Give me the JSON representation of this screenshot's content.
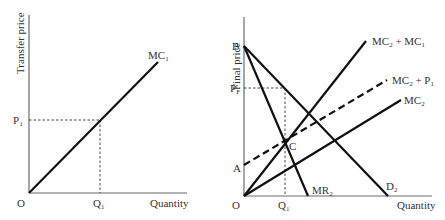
{
  "left_panel": {
    "y_axis_label": "Transfer price",
    "x_axis_label": "Quantity",
    "origin_label": "O",
    "curves": [
      {
        "id": "mc1",
        "label": "MC",
        "sub": "1",
        "type": "solid"
      }
    ],
    "y_marks": [
      {
        "label": "P",
        "sub": "1"
      }
    ],
    "x_marks": [
      {
        "label": "Q",
        "sub": "1"
      }
    ]
  },
  "right_panel": {
    "y_axis_label": "Final price",
    "x_axis_label": "Quantity",
    "origin_label": "O",
    "points": [
      {
        "id": "B",
        "label": "B"
      },
      {
        "id": "A",
        "label": "A"
      },
      {
        "id": "C",
        "label": "C"
      }
    ],
    "y_marks": [
      {
        "label": "P",
        "sub": "F"
      }
    ],
    "x_marks": [
      {
        "label": "Q",
        "sub": "1"
      }
    ],
    "curves": [
      {
        "id": "mc2_mc1",
        "label": "MC",
        "sub": "2",
        "label2": " + MC",
        "sub2": "1",
        "type": "solid"
      },
      {
        "id": "mc2_p1",
        "label": "MC",
        "sub": "2",
        "label2": " + P",
        "sub2": "1",
        "type": "dashed"
      },
      {
        "id": "mc2",
        "label": "MC",
        "sub": "2",
        "type": "solid"
      },
      {
        "id": "mr2",
        "label": "MR",
        "sub": "2",
        "type": "solid"
      },
      {
        "id": "d2",
        "label": "D",
        "sub": "2",
        "type": "solid"
      }
    ]
  }
}
